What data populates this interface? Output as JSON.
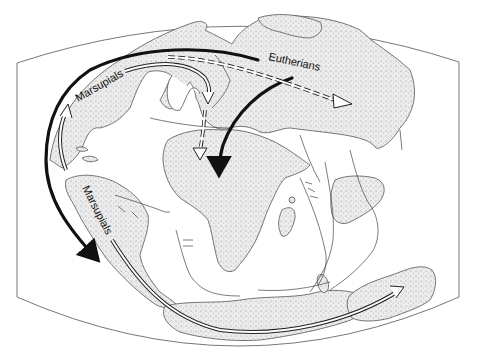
{
  "map": {
    "title": "Cretaceous mammal dispersal routes",
    "labels": {
      "marsupials_north": "Marsupials",
      "marsupials_south": "Marsupials",
      "eutherians": "Eutherians"
    },
    "legend_routes": [
      {
        "group": "Marsupials",
        "style": "hollow-arrow",
        "direction": "North America → Europe / Asia"
      },
      {
        "group": "Marsupials",
        "style": "bold-arrow",
        "direction": "North America → South America"
      },
      {
        "group": "Marsupials",
        "style": "hollow-arrow",
        "direction": "South America → Antarctica → Australia"
      },
      {
        "group": "Eutherians",
        "style": "bold-arrow",
        "direction": "Asia → Africa"
      },
      {
        "group": "Eutherians",
        "style": "dashed-hollow-arrow",
        "direction": "Asia eastward"
      },
      {
        "group": "Eutherians",
        "style": "dashed-hollow-arrow",
        "direction": "Europe → Africa"
      }
    ],
    "colors": {
      "land_fill": "#e4e4e4",
      "stipple": "#8a8a8a",
      "ink": "#111111",
      "frame": "#777777",
      "background": "#ffffff"
    }
  }
}
